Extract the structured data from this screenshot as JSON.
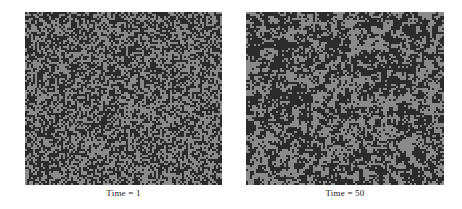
{
  "figure": {
    "type": "two-panel-lattice-figure",
    "background_color": "#ffffff",
    "width": 462,
    "height": 209
  },
  "chart_data": {
    "type": "heatmap",
    "title": "",
    "subtitle": "",
    "xlabel": "",
    "ylabel": "",
    "grid": false,
    "legend": "none",
    "colors": {
      "state_dark": "#2b2b2b",
      "state_light": "#8a8a8a",
      "background": "#ffffff"
    },
    "states": [
      {
        "name": "occupied",
        "color": "#2b2b2b"
      },
      {
        "name": "empty",
        "color": "#8a8a8a"
      }
    ],
    "grid_shape": {
      "cols": 98,
      "rows": 86,
      "cell_px": 2
    },
    "panels": [
      {
        "id": "panel-time-1",
        "caption": "Time = 1",
        "time": 1,
        "dark_fraction": 0.5,
        "cluster_scale": 1.0,
        "seed": 1
      },
      {
        "id": "panel-time-50",
        "caption": "Time = 50",
        "time": 50,
        "dark_fraction": 0.52,
        "cluster_scale": 1.35,
        "seed": 50
      }
    ]
  },
  "panels": [
    {
      "caption": "Time = 1"
    },
    {
      "caption": "Time = 50"
    }
  ]
}
